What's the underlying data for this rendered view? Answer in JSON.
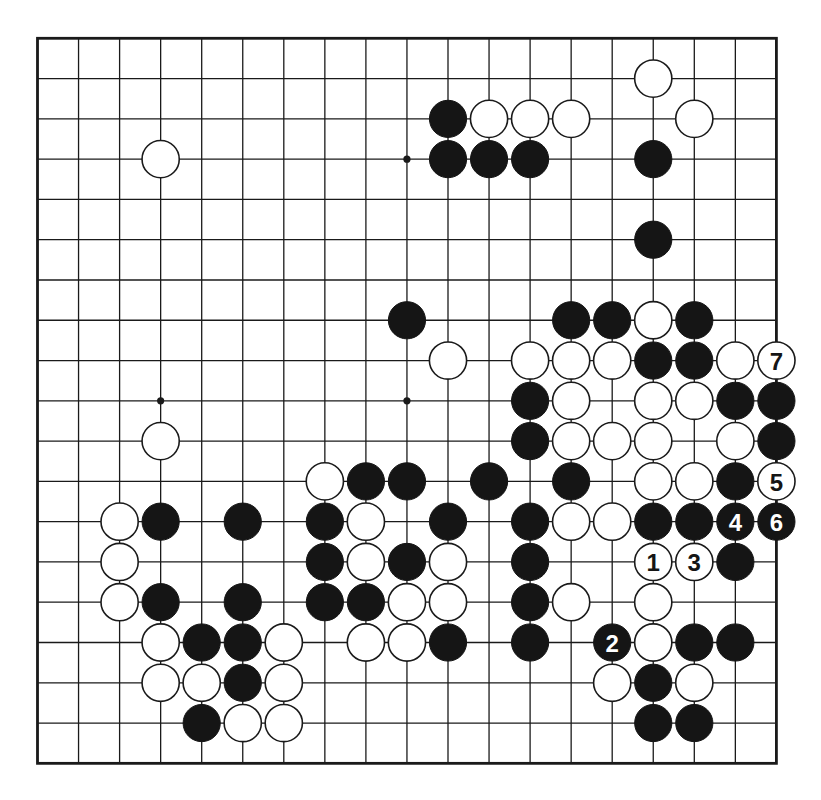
{
  "board": {
    "size": 19,
    "origin_x": 37.5,
    "origin_y": 38.3,
    "spacing_x": 41.05,
    "spacing_y": 40.28,
    "stone_radius": 18.6,
    "colors": {
      "line": "#1a1a1a",
      "black_stone": "#151515",
      "white_stone": "#ffffff",
      "background": "#ffffff"
    },
    "hoshi": [
      [
        3,
        3
      ],
      [
        9,
        3
      ],
      [
        3,
        9
      ],
      [
        9,
        9
      ]
    ],
    "stones": [
      {
        "col": 15,
        "row": 1,
        "color": "white"
      },
      {
        "col": 10,
        "row": 2,
        "color": "black"
      },
      {
        "col": 11,
        "row": 2,
        "color": "white"
      },
      {
        "col": 12,
        "row": 2,
        "color": "white"
      },
      {
        "col": 13,
        "row": 2,
        "color": "white"
      },
      {
        "col": 16,
        "row": 2,
        "color": "white"
      },
      {
        "col": 3,
        "row": 3,
        "color": "white"
      },
      {
        "col": 10,
        "row": 3,
        "color": "black"
      },
      {
        "col": 11,
        "row": 3,
        "color": "black"
      },
      {
        "col": 12,
        "row": 3,
        "color": "black"
      },
      {
        "col": 15,
        "row": 3,
        "color": "black"
      },
      {
        "col": 15,
        "row": 5,
        "color": "black"
      },
      {
        "col": 9,
        "row": 7,
        "color": "black"
      },
      {
        "col": 13,
        "row": 7,
        "color": "black"
      },
      {
        "col": 14,
        "row": 7,
        "color": "black"
      },
      {
        "col": 15,
        "row": 7,
        "color": "white"
      },
      {
        "col": 16,
        "row": 7,
        "color": "black"
      },
      {
        "col": 10,
        "row": 8,
        "color": "white"
      },
      {
        "col": 12,
        "row": 8,
        "color": "white"
      },
      {
        "col": 13,
        "row": 8,
        "color": "white"
      },
      {
        "col": 14,
        "row": 8,
        "color": "white"
      },
      {
        "col": 15,
        "row": 8,
        "color": "black"
      },
      {
        "col": 16,
        "row": 8,
        "color": "black"
      },
      {
        "col": 17,
        "row": 8,
        "color": "white"
      },
      {
        "col": 18,
        "row": 8,
        "color": "white",
        "label": "7"
      },
      {
        "col": 12,
        "row": 9,
        "color": "black"
      },
      {
        "col": 13,
        "row": 9,
        "color": "white"
      },
      {
        "col": 15,
        "row": 9,
        "color": "white"
      },
      {
        "col": 16,
        "row": 9,
        "color": "white"
      },
      {
        "col": 17,
        "row": 9,
        "color": "black"
      },
      {
        "col": 18,
        "row": 9,
        "color": "black"
      },
      {
        "col": 3,
        "row": 10,
        "color": "white"
      },
      {
        "col": 12,
        "row": 10,
        "color": "black"
      },
      {
        "col": 13,
        "row": 10,
        "color": "white"
      },
      {
        "col": 14,
        "row": 10,
        "color": "white"
      },
      {
        "col": 15,
        "row": 10,
        "color": "white"
      },
      {
        "col": 17,
        "row": 10,
        "color": "white"
      },
      {
        "col": 18,
        "row": 10,
        "color": "black"
      },
      {
        "col": 7,
        "row": 11,
        "color": "white"
      },
      {
        "col": 8,
        "row": 11,
        "color": "black"
      },
      {
        "col": 9,
        "row": 11,
        "color": "black"
      },
      {
        "col": 11,
        "row": 11,
        "color": "black"
      },
      {
        "col": 13,
        "row": 11,
        "color": "black"
      },
      {
        "col": 15,
        "row": 11,
        "color": "white"
      },
      {
        "col": 16,
        "row": 11,
        "color": "white"
      },
      {
        "col": 17,
        "row": 11,
        "color": "black"
      },
      {
        "col": 18,
        "row": 11,
        "color": "white",
        "label": "5"
      },
      {
        "col": 2,
        "row": 12,
        "color": "white"
      },
      {
        "col": 3,
        "row": 12,
        "color": "black"
      },
      {
        "col": 5,
        "row": 12,
        "color": "black"
      },
      {
        "col": 7,
        "row": 12,
        "color": "black"
      },
      {
        "col": 8,
        "row": 12,
        "color": "white"
      },
      {
        "col": 10,
        "row": 12,
        "color": "black"
      },
      {
        "col": 12,
        "row": 12,
        "color": "black"
      },
      {
        "col": 13,
        "row": 12,
        "color": "white"
      },
      {
        "col": 14,
        "row": 12,
        "color": "white"
      },
      {
        "col": 15,
        "row": 12,
        "color": "black"
      },
      {
        "col": 16,
        "row": 12,
        "color": "black"
      },
      {
        "col": 17,
        "row": 12,
        "color": "black",
        "label": "4"
      },
      {
        "col": 18,
        "row": 12,
        "color": "black",
        "label": "6"
      },
      {
        "col": 2,
        "row": 13,
        "color": "white"
      },
      {
        "col": 7,
        "row": 13,
        "color": "black"
      },
      {
        "col": 8,
        "row": 13,
        "color": "white"
      },
      {
        "col": 9,
        "row": 13,
        "color": "black"
      },
      {
        "col": 10,
        "row": 13,
        "color": "white"
      },
      {
        "col": 12,
        "row": 13,
        "color": "black"
      },
      {
        "col": 15,
        "row": 13,
        "color": "white",
        "label": "1"
      },
      {
        "col": 16,
        "row": 13,
        "color": "white",
        "label": "3"
      },
      {
        "col": 17,
        "row": 13,
        "color": "black"
      },
      {
        "col": 2,
        "row": 14,
        "color": "white"
      },
      {
        "col": 3,
        "row": 14,
        "color": "black"
      },
      {
        "col": 5,
        "row": 14,
        "color": "black"
      },
      {
        "col": 7,
        "row": 14,
        "color": "black"
      },
      {
        "col": 8,
        "row": 14,
        "color": "black"
      },
      {
        "col": 9,
        "row": 14,
        "color": "white"
      },
      {
        "col": 10,
        "row": 14,
        "color": "white"
      },
      {
        "col": 12,
        "row": 14,
        "color": "black"
      },
      {
        "col": 13,
        "row": 14,
        "color": "white"
      },
      {
        "col": 15,
        "row": 14,
        "color": "white"
      },
      {
        "col": 3,
        "row": 15,
        "color": "white"
      },
      {
        "col": 4,
        "row": 15,
        "color": "black"
      },
      {
        "col": 5,
        "row": 15,
        "color": "black"
      },
      {
        "col": 6,
        "row": 15,
        "color": "white"
      },
      {
        "col": 8,
        "row": 15,
        "color": "white"
      },
      {
        "col": 9,
        "row": 15,
        "color": "white"
      },
      {
        "col": 10,
        "row": 15,
        "color": "black"
      },
      {
        "col": 12,
        "row": 15,
        "color": "black"
      },
      {
        "col": 14,
        "row": 15,
        "color": "black",
        "label": "2"
      },
      {
        "col": 15,
        "row": 15,
        "color": "white"
      },
      {
        "col": 16,
        "row": 15,
        "color": "black"
      },
      {
        "col": 17,
        "row": 15,
        "color": "black"
      },
      {
        "col": 3,
        "row": 16,
        "color": "white"
      },
      {
        "col": 4,
        "row": 16,
        "color": "white"
      },
      {
        "col": 5,
        "row": 16,
        "color": "black"
      },
      {
        "col": 6,
        "row": 16,
        "color": "white"
      },
      {
        "col": 14,
        "row": 16,
        "color": "white"
      },
      {
        "col": 15,
        "row": 16,
        "color": "black"
      },
      {
        "col": 16,
        "row": 16,
        "color": "white"
      },
      {
        "col": 4,
        "row": 17,
        "color": "black"
      },
      {
        "col": 5,
        "row": 17,
        "color": "white"
      },
      {
        "col": 6,
        "row": 17,
        "color": "white"
      },
      {
        "col": 15,
        "row": 17,
        "color": "black"
      },
      {
        "col": 16,
        "row": 17,
        "color": "black"
      }
    ],
    "move_sequence": [
      {
        "number": "1",
        "color": "white",
        "col": 15,
        "row": 13
      },
      {
        "number": "2",
        "color": "black",
        "col": 14,
        "row": 15
      },
      {
        "number": "3",
        "color": "white",
        "col": 16,
        "row": 13
      },
      {
        "number": "4",
        "color": "black",
        "col": 17,
        "row": 12
      },
      {
        "number": "5",
        "color": "white",
        "col": 18,
        "row": 11
      },
      {
        "number": "6",
        "color": "black",
        "col": 18,
        "row": 12
      },
      {
        "number": "7",
        "color": "white",
        "col": 18,
        "row": 8
      }
    ]
  }
}
